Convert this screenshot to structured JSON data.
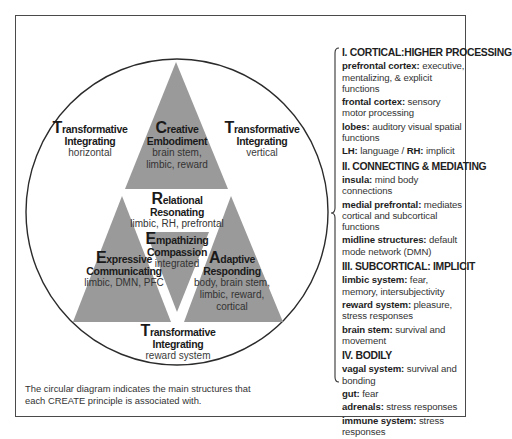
{
  "diagram": {
    "colors": {
      "triangle_fill": "#9a9a9a",
      "circle_stroke": "#2b2b2b",
      "frame_stroke": "#4a4a4a",
      "background": "#ffffff"
    },
    "labels": {
      "transformative_horizontal": {
        "cap": "T",
        "title_rest": "ransformative",
        "line2": "Integrating",
        "sub": "horizontal"
      },
      "transformative_vertical": {
        "cap": "T",
        "title_rest": "ransformative",
        "line2": "Integrating",
        "sub": "vertical"
      },
      "transformative_reward": {
        "cap": "T",
        "title_rest": "ransformative",
        "line2": "Integrating",
        "sub": "reward system"
      },
      "creative": {
        "cap": "C",
        "title_rest": "reative",
        "line2": "Embodiment",
        "sub1": "brain stem,",
        "sub2": "limbic, reward"
      },
      "relational": {
        "cap": "R",
        "title_rest": "elational",
        "line2": "Resonating",
        "sub": "limbic, RH, prefrontal"
      },
      "empathizing": {
        "cap": "E",
        "title_rest": "mpathizing",
        "line2": "Compassion",
        "sub": "integrated"
      },
      "expressive": {
        "cap": "E",
        "title_rest": "xpressive",
        "line2": "Communicating",
        "sub": "limbic, DMN, PFC"
      },
      "adaptive": {
        "cap": "A",
        "title_rest": "daptive",
        "line2": "Responding",
        "sub1": "body, brain stem,",
        "sub2": "limbic, reward,",
        "sub3": "cortical"
      }
    },
    "caption": "The circular diagram indicates the main structures that each CREATE principle is associated with."
  },
  "legend": {
    "sections": [
      {
        "title": "I. CORTICAL:HIGHER PROCESSING",
        "items": [
          {
            "key": "prefrontal cortex:",
            "value": " executive, mentalizing, & explicit functions"
          },
          {
            "key": "frontal cortex:",
            "value": " sensory motor processing"
          },
          {
            "key": "lobes:",
            "value": " auditory visual spatial functions"
          },
          {
            "key": "LH:",
            "value": " language / ",
            "key2": "RH:",
            "value2": " implicit"
          }
        ]
      },
      {
        "title": "II. CONNECTING & MEDIATING",
        "items": [
          {
            "key": "insula:",
            "value": " mind body connections"
          },
          {
            "key": "medial prefrontal:",
            "value": " mediates cortical and subcortical functions"
          },
          {
            "key": "midline structures:",
            "value": " default mode network (DMN)"
          }
        ]
      },
      {
        "title": "III. SUBCORTICAL: IMPLICIT",
        "items": [
          {
            "key": "limbic system:",
            "value": " fear, memory, intersubjectivity"
          },
          {
            "key": "reward system:",
            "value": " pleasure, stress responses"
          },
          {
            "key": "brain stem:",
            "value": " survival and movement"
          }
        ]
      },
      {
        "title": "IV. BODILY",
        "items": [
          {
            "key": "vagal system:",
            "value": " survival and bonding"
          },
          {
            "key": "gut:",
            "value": " fear"
          },
          {
            "key": "adrenals:",
            "value": " stress responses"
          },
          {
            "key": "immune system:",
            "value": " stress responses"
          }
        ]
      }
    ]
  }
}
